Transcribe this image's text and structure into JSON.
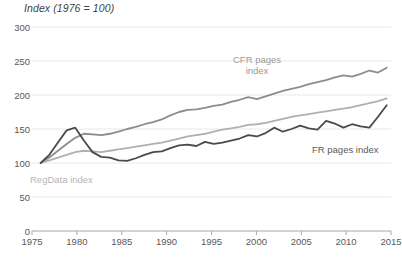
{
  "chart_data": {
    "type": "line",
    "title": "Index (1976 = 100)",
    "xlabel": "",
    "ylabel": "",
    "xlim": [
      1975,
      2016.5
    ],
    "ylim": [
      0,
      300
    ],
    "grid": true,
    "legend_position": "inline-annotations",
    "xticks": [
      "1975",
      "1980",
      "1985",
      "1990",
      "1995",
      "2000",
      "2005",
      "2010",
      "2015"
    ],
    "xtick_values": [
      1975,
      1980,
      1985,
      1990,
      1995,
      2000,
      2005,
      2010,
      2015
    ],
    "yticks": [
      "0",
      "50",
      "100",
      "150",
      "200",
      "250",
      "300"
    ],
    "ytick_values": [
      0,
      50,
      100,
      150,
      200,
      250,
      300
    ],
    "x": [
      1976,
      1977,
      1978,
      1979,
      1980,
      1981,
      1982,
      1983,
      1984,
      1985,
      1986,
      1987,
      1988,
      1989,
      1990,
      1991,
      1992,
      1993,
      1994,
      1995,
      1996,
      1997,
      1998,
      1999,
      2000,
      2001,
      2002,
      2003,
      2004,
      2005,
      2006,
      2007,
      2008,
      2009,
      2010,
      2011,
      2012,
      2013,
      2014,
      2015,
      2016
    ],
    "series": [
      {
        "name": "CFR pages index",
        "color": "#8c8c8c",
        "values": [
          100,
          108,
          118,
          128,
          137,
          143,
          142,
          141,
          143,
          146,
          150,
          153,
          157,
          160,
          164,
          170,
          175,
          178,
          179,
          181,
          184,
          186,
          190,
          193,
          197,
          194,
          198,
          202,
          206,
          209,
          212,
          216,
          219,
          222,
          226,
          229,
          227,
          231,
          236,
          233,
          240
        ]
      },
      {
        "name": "RegData index",
        "color": "#b0b0b0",
        "values": [
          100,
          104,
          108,
          112,
          116,
          118,
          117,
          116,
          118,
          120,
          122,
          124,
          126,
          128,
          130,
          133,
          136,
          139,
          141,
          143,
          146,
          149,
          151,
          153,
          156,
          157,
          159,
          162,
          165,
          168,
          170,
          172,
          174,
          176,
          178,
          180,
          182,
          185,
          188,
          191,
          195
        ]
      },
      {
        "name": "FR pages index",
        "color": "#4a4a4a",
        "values": [
          100,
          112,
          130,
          148,
          152,
          133,
          116,
          109,
          108,
          104,
          103,
          107,
          112,
          116,
          117,
          122,
          126,
          127,
          125,
          131,
          128,
          130,
          133,
          136,
          141,
          139,
          144,
          152,
          146,
          150,
          155,
          151,
          149,
          162,
          158,
          152,
          157,
          154,
          152,
          168,
          185
        ]
      }
    ],
    "annotations": [
      {
        "name": "cfr-label",
        "text": "CFR pages\nindex",
        "color": "#9a9a9a"
      },
      {
        "name": "regdata-label",
        "text": "RegData index",
        "color": "#b5b5b5"
      },
      {
        "name": "fr-label",
        "text": "FR pages index",
        "color": "#5a5a5a"
      }
    ],
    "colors": {
      "cfr": "#8c8c8c",
      "regdata": "#b0b0b0",
      "fr": "#4a4a4a",
      "grid": "#e4e4e4",
      "axis": "#a6a6a6",
      "tick_text": "#595959",
      "title_text": "#3f3f3f"
    }
  }
}
